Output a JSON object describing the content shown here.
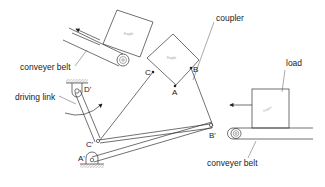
{
  "diagram": {
    "type": "mechanism",
    "labels": {
      "conveyer_belt_top": "conveyer belt",
      "conveyer_belt_bottom": "conveyer belt",
      "driving_link": "driving link",
      "coupler": "coupler",
      "load": "load"
    },
    "points": {
      "A": "A",
      "B": "B",
      "C": "C",
      "A_prime": "A'",
      "B_prime": "B'",
      "C_prime": "C'",
      "D_prime": "D'"
    },
    "box_text": {
      "top_left_box": "Fragile",
      "coupler_box": "Fragile",
      "load_box": "Fragile"
    },
    "colors": {
      "line": "#333333",
      "background": "#ffffff"
    }
  }
}
